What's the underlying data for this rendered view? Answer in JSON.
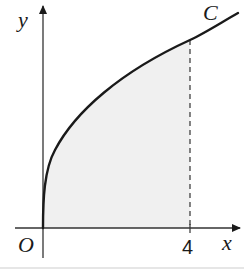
{
  "diagram": {
    "curve_label": "C",
    "axis_labels": {
      "x": "x",
      "y": "y",
      "origin": "O"
    },
    "tick_labels": {
      "x_boundary": "4"
    },
    "curve_type": "y = k√x",
    "shaded_region": {
      "from_x": 0,
      "to_x": 4
    },
    "colors": {
      "stroke": "#1a1a1a",
      "axis": "#333333",
      "fill": "#f0f0f0",
      "dashed": "#333333",
      "bottom_rule": "#e6e6e6"
    }
  }
}
